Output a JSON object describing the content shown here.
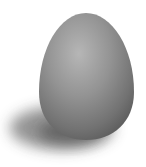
{
  "image": {
    "subject": "egg",
    "description": "Grayscale egg with soft cast shadow on white background",
    "colors": {
      "background": "#ffffff",
      "egg_highlight": "#b4b4b4",
      "egg_mid": "#8c8c8c",
      "egg_dark": "#5a5a5a",
      "shadow": "#3c3c3c"
    }
  }
}
